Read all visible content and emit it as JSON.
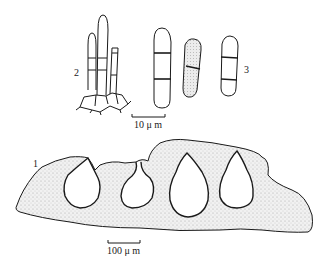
{
  "figure": {
    "labels": {
      "fig1": "1",
      "fig2": "2",
      "fig3": "3"
    },
    "scale_bars": {
      "small": "10 μ m",
      "large": "100 μ m"
    },
    "colors": {
      "ink": "#1a1a1a",
      "stipple": "#b8b8b8",
      "background": "#ffffff"
    }
  }
}
